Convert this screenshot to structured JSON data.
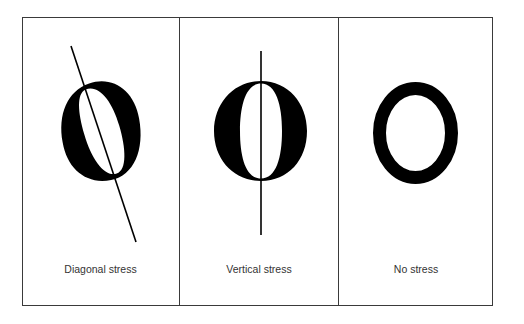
{
  "figure": {
    "panels": [
      {
        "label": "Diagonal stress",
        "stress": "diagonal"
      },
      {
        "label": "Vertical stress",
        "stress": "vertical"
      },
      {
        "label": "No stress",
        "stress": "none"
      }
    ]
  },
  "colors": {
    "ink": "#000000",
    "border": "#3a3a3a",
    "label_text": "#333333",
    "background": "#ffffff"
  }
}
